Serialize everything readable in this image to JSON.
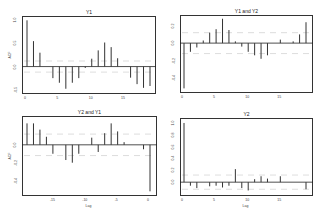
{
  "chart_data": [
    {
      "type": "bar",
      "title": "Y1",
      "xlabel": "",
      "ylabel": "ACF",
      "x": [
        0,
        1,
        2,
        3,
        4,
        5,
        6,
        7,
        8,
        9,
        10,
        11,
        12,
        13,
        14,
        15,
        16,
        17,
        18,
        19
      ],
      "values": [
        1.0,
        0.55,
        0.3,
        0.0,
        -0.25,
        -0.35,
        -0.48,
        -0.35,
        -0.25,
        -0.03,
        0.17,
        0.35,
        0.52,
        0.42,
        0.18,
        0.0,
        -0.24,
        -0.38,
        -0.46,
        -0.42
      ],
      "xticks": [
        "0",
        "5",
        "10",
        "15"
      ],
      "yticks": [
        "-0.5",
        "0.0",
        "0.5",
        "1.0"
      ],
      "ylim": [
        -0.55,
        1.05
      ],
      "ci": 0.12,
      "grid": false
    },
    {
      "type": "bar",
      "title": "Y1 and Y2",
      "xlabel": "",
      "ylabel": "",
      "x": [
        0,
        1,
        2,
        3,
        4,
        5,
        6,
        7,
        8,
        9,
        10,
        11,
        12,
        13,
        14,
        15,
        16,
        17,
        18,
        19
      ],
      "values": [
        -0.52,
        -0.1,
        -0.05,
        0.03,
        0.12,
        0.16,
        0.28,
        0.15,
        0.02,
        -0.04,
        -0.1,
        -0.14,
        -0.18,
        -0.14,
        0.0,
        0.04,
        0.0,
        0.02,
        0.1,
        0.24,
        0.09
      ],
      "xticks": [
        "0",
        "5",
        "10",
        "15"
      ],
      "yticks": [
        "-0.4",
        "-0.2",
        "0.0",
        "0.2"
      ],
      "ylim": [
        -0.55,
        0.3
      ],
      "ci": 0.12,
      "grid": false
    },
    {
      "type": "bar",
      "title": "Y2 and Y1",
      "xlabel": "Lag",
      "ylabel": "ACF",
      "x": [
        -19,
        -18,
        -17,
        -16,
        -15,
        -14,
        -13,
        -12,
        -11,
        -10,
        -9,
        -8,
        -7,
        -6,
        -5,
        -4,
        -3,
        -2,
        -1,
        0
      ],
      "values": [
        0.24,
        0.24,
        0.17,
        0.09,
        -0.1,
        0.0,
        -0.17,
        -0.2,
        -0.1,
        0.0,
        0.08,
        -0.08,
        0.13,
        0.24,
        0.15,
        0.03,
        0.0,
        0.0,
        -0.05,
        -0.52
      ],
      "xticks": [
        "-15",
        "-10",
        "-5",
        "0"
      ],
      "yticks": [
        "-0.4",
        "-0.2",
        "0.0"
      ],
      "ylim": [
        -0.55,
        0.3
      ],
      "ci": 0.12,
      "grid": false
    },
    {
      "type": "bar",
      "title": "Y2",
      "xlabel": "Lag",
      "ylabel": "",
      "x": [
        0,
        1,
        2,
        3,
        4,
        5,
        6,
        7,
        8,
        9,
        10,
        11,
        12,
        13,
        14,
        15,
        16,
        17,
        18,
        19
      ],
      "values": [
        1.0,
        -0.06,
        -0.1,
        0.0,
        -0.07,
        -0.06,
        -0.09,
        -0.06,
        0.22,
        -0.1,
        -0.14,
        0.05,
        0.1,
        0.06,
        0.0,
        0.1,
        0.0,
        0.0,
        0.0,
        -0.12
      ],
      "xticks": [
        "0",
        "5",
        "10",
        "15"
      ],
      "yticks": [
        "0.0",
        "0.2",
        "0.4",
        "0.6",
        "0.8",
        "1.0"
      ],
      "ylim": [
        -0.2,
        1.05
      ],
      "ci": 0.12,
      "grid": false
    }
  ],
  "panels": [
    {
      "title": "Y1",
      "ylabel": "ACF",
      "xlabel": ""
    },
    {
      "title": "Y1 and Y2",
      "ylabel": "",
      "xlabel": ""
    },
    {
      "title": "Y2 and Y1",
      "ylabel": "ACF",
      "xlabel": "Lag"
    },
    {
      "title": "Y2",
      "ylabel": "",
      "xlabel": "Lag"
    }
  ]
}
